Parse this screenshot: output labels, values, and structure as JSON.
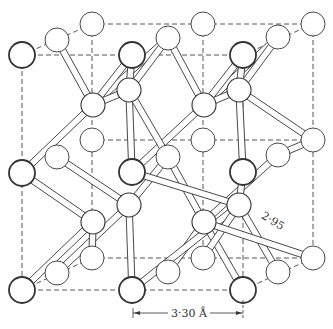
{
  "diagram": {
    "type": "crystal-structure",
    "labels": {
      "lattice_spacing": "3·30 Å",
      "bond_length": "2·95"
    },
    "colors": {
      "line": "#333333",
      "background": "#ffffff"
    },
    "atoms_front": [
      [
        22,
        55
      ],
      [
        132,
        55
      ],
      [
        243,
        55
      ],
      [
        22,
        173
      ],
      [
        132,
        172
      ],
      [
        243,
        172
      ],
      [
        22,
        290
      ],
      [
        132,
        290
      ],
      [
        243,
        290
      ]
    ],
    "atoms_mid": [
      [
        57,
        40
      ],
      [
        168,
        38
      ],
      [
        278,
        37
      ],
      [
        57,
        157
      ],
      [
        168,
        157
      ],
      [
        278,
        155
      ],
      [
        57,
        273
      ],
      [
        168,
        272
      ],
      [
        278,
        272
      ]
    ],
    "atoms_back": [
      [
        92,
        24
      ],
      [
        203,
        24
      ],
      [
        313,
        24
      ],
      [
        92,
        140
      ],
      [
        203,
        140
      ],
      [
        313,
        140
      ],
      [
        92,
        258
      ],
      [
        203,
        258
      ],
      [
        313,
        258
      ]
    ],
    "atoms_interior": [
      [
        93,
        105
      ],
      [
        129,
        90
      ],
      [
        204,
        105
      ],
      [
        239,
        90
      ],
      [
        129,
        205
      ],
      [
        93,
        222
      ],
      [
        204,
        222
      ],
      [
        239,
        205
      ]
    ]
  }
}
